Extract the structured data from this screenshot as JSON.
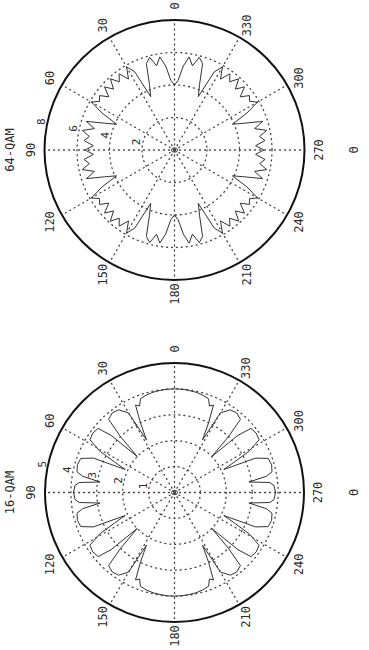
{
  "figure": {
    "orientation": "rotated -90deg (figure printed sideways)",
    "theta_symbol": "Θ"
  },
  "chart_data": [
    {
      "type": "line",
      "subtype": "polar",
      "title": "64-QAM",
      "xlabel": "Θ",
      "angle_ticks": [
        "0",
        "30",
        "60",
        "90",
        "120",
        "150",
        "180",
        "210",
        "240",
        "270",
        "300",
        "330"
      ],
      "radial_ticks": [
        "2",
        "4",
        "6",
        "8"
      ],
      "rlim": [
        0,
        8
      ],
      "grid": true,
      "symmetry": "mirror about 90° and 180° (quadrant 0–90 listed)",
      "theta_deg": [
        0,
        3,
        6,
        9,
        12,
        15,
        18,
        21,
        24,
        27,
        30,
        33,
        36,
        39,
        42,
        45,
        48,
        51,
        54,
        57,
        60,
        63,
        66,
        69,
        72,
        75,
        78,
        81,
        84,
        87,
        90
      ],
      "r": [
        4.0,
        4.3,
        5.2,
        5.8,
        5.3,
        5.9,
        5.6,
        4.3,
        3.6,
        5.4,
        5.9,
        5.2,
        5.8,
        5.4,
        5.9,
        5.3,
        5.8,
        5.2,
        5.7,
        5.5,
        5.9,
        5.0,
        3.9,
        4.6,
        5.7,
        5.1,
        5.8,
        5.3,
        5.6,
        5.0,
        5.5
      ]
    },
    {
      "type": "line",
      "subtype": "polar",
      "title": "16-QAM",
      "xlabel": "Θ",
      "angle_ticks": [
        "0",
        "30",
        "60",
        "90",
        "120",
        "150",
        "180",
        "210",
        "240",
        "270",
        "300",
        "330"
      ],
      "radial_ticks": [
        "1",
        "2",
        "3",
        "4",
        "5"
      ],
      "rlim": [
        0,
        5
      ],
      "grid": true,
      "symmetry": "mirror about 90° and 180° (quadrant 0–90 listed)",
      "theta_deg": [
        0,
        4,
        8,
        12,
        16,
        20,
        22,
        24,
        26,
        28,
        30,
        34,
        38,
        42,
        44,
        46,
        48,
        50,
        54,
        58,
        61,
        63,
        65,
        67,
        70,
        74,
        78,
        80,
        82,
        84,
        86,
        90
      ],
      "r": [
        4.0,
        4.0,
        3.98,
        3.96,
        3.92,
        3.85,
        3.6,
        3.7,
        3.0,
        2.3,
        3.55,
        3.85,
        3.9,
        3.8,
        3.0,
        2.0,
        3.3,
        3.85,
        3.9,
        3.85,
        3.3,
        2.6,
        2.1,
        3.4,
        3.85,
        3.9,
        3.85,
        3.6,
        2.9,
        3.7,
        3.85,
        3.9
      ]
    }
  ]
}
